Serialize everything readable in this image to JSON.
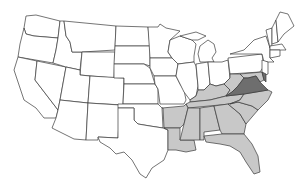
{
  "map": {
    "title": "United States map with highlighted southern states",
    "colors": {
      "background": "#ffffff",
      "unshaded": "#ffffff",
      "shaded": "#c8c8c8",
      "highlight": "#6e6e6e",
      "border": "#3a3a3a"
    },
    "highlighted_states": [
      "Virginia"
    ],
    "shaded_states": [
      "Kentucky",
      "Tennessee",
      "Arkansas",
      "Louisiana",
      "Mississippi",
      "Alabama",
      "Georgia",
      "Florida",
      "South Carolina",
      "North Carolina",
      "West Virginia",
      "Maryland"
    ]
  }
}
